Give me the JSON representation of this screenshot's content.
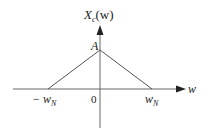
{
  "diagram": {
    "y_axis_label": {
      "main": "X",
      "sub": "c",
      "arg": "(w)"
    },
    "x_axis_label": "w",
    "peak_label": "A",
    "origin_label": "0",
    "left_label": {
      "main": "− w",
      "sub": "N"
    },
    "right_label": {
      "main": "w",
      "sub": "N"
    },
    "colors": {
      "axis": "#555555",
      "curve": "#555555",
      "text": "#222222",
      "background": "#ffffff"
    }
  }
}
